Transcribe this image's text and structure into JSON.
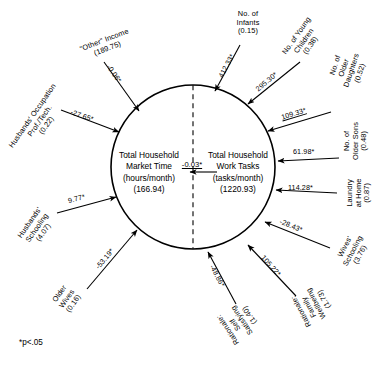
{
  "figure": {
    "type": "path-diagram",
    "footnote": "*p<.05",
    "center": {
      "left_node": {
        "line1": "Total Household",
        "line2": "Market Time",
        "line3": "(hours/month)",
        "line4": "(166.94)"
      },
      "right_node": {
        "line1": "Total Household",
        "line2": "Work Tasks",
        "line3": "(tasks/month)",
        "line4": "(1220.93)"
      },
      "cross_coefficient": "-0.03*"
    },
    "variables": [
      {
        "id": "other-income",
        "label_lines": [
          "\"Other\" Income",
          "(189.75)"
        ],
        "coefficient": "-0.06*",
        "target": "market-time",
        "angle_deg": 225
      },
      {
        "id": "husbands-occupation",
        "label_lines": [
          "Husbands' Occupation",
          "Prof./Tech.",
          "(0.22)"
        ],
        "coefficient": "-27.65*",
        "target": "market-time",
        "angle_deg": 198
      },
      {
        "id": "husbands-schooling",
        "label_lines": [
          "Husbands'",
          "Schooling",
          "(4.07)"
        ],
        "coefficient": "9.77*",
        "target": "market-time",
        "angle_deg": 163
      },
      {
        "id": "older-wives",
        "label_lines": [
          "Older",
          "Wives",
          "(0.16)"
        ],
        "coefficient": "-53.19*",
        "target": "market-time",
        "angle_deg": 135
      },
      {
        "id": "no-of-infants",
        "label_lines": [
          "No. of",
          "Infants",
          "(0.15)"
        ],
        "coefficient": "412.33*",
        "target": "work-tasks",
        "angle_deg": 285
      },
      {
        "id": "no-of-young-children",
        "label_lines": [
          "No. of Young",
          "Children",
          "(0.38)"
        ],
        "coefficient": "295.30*",
        "target": "work-tasks",
        "angle_deg": 305
      },
      {
        "id": "no-of-older-daughters",
        "label_lines": [
          "No. of",
          "Older",
          "Daughters",
          "(0.52)"
        ],
        "coefficient": "109.33*",
        "target": "work-tasks",
        "angle_deg": 325
      },
      {
        "id": "no-of-older-sons",
        "label_lines": [
          "No. of",
          "Older Sons",
          "(0.48)"
        ],
        "coefficient": "61.98*",
        "target": "work-tasks",
        "angle_deg": 355
      },
      {
        "id": "laundry-at-home",
        "label_lines": [
          "Laundry",
          "at Home",
          "(0.87)"
        ],
        "coefficient": "114.28*",
        "target": "work-tasks",
        "angle_deg": 10
      },
      {
        "id": "wives-schooling",
        "label_lines": [
          "Wives'",
          "Schooling",
          "(3.76)"
        ],
        "coefficient": "-28.43*",
        "target": "work-tasks",
        "angle_deg": 35
      },
      {
        "id": "rationale-family-wellbeing",
        "label_lines": [
          "Rationale:",
          "Family",
          "Wellbeing",
          "(1.73)"
        ],
        "coefficient": "105.22*",
        "target": "work-tasks",
        "angle_deg": 58
      },
      {
        "id": "rationale-self-satisfying",
        "label_lines": [
          "Rationale:",
          "Self",
          "Satisfying",
          "(1.40)"
        ],
        "coefficient": "-48.86*",
        "target": "work-tasks",
        "angle_deg": 80
      }
    ]
  }
}
